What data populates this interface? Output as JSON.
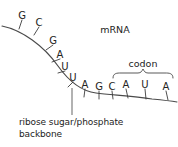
{
  "figure": {
    "title_label": "mRNA",
    "codon_label": "codon",
    "caption_line_1": "ribose sugar/phosphate",
    "caption_line_2": "backbone",
    "stroke_color": "#3c3c3c",
    "text_color": "#232323",
    "background_color": "#ffffff"
  },
  "sequence": {
    "description": "mRNA nucleotide bases along ribose sugar/phosphate backbone",
    "bases": [
      {
        "letter": "G",
        "x": 22,
        "y": 15
      },
      {
        "letter": "C",
        "x": 39,
        "y": 22
      },
      {
        "letter": "G",
        "x": 53,
        "y": 40
      },
      {
        "letter": "A",
        "x": 60,
        "y": 54
      },
      {
        "letter": "U",
        "x": 65,
        "y": 66
      },
      {
        "letter": "U",
        "x": 73,
        "y": 77
      },
      {
        "letter": "A",
        "x": 85,
        "y": 84
      },
      {
        "letter": "G",
        "x": 99,
        "y": 86
      },
      {
        "letter": "C",
        "x": 112,
        "y": 86
      },
      {
        "letter": "A",
        "x": 126,
        "y": 84
      },
      {
        "letter": "U",
        "x": 145,
        "y": 84
      },
      {
        "letter": "A",
        "x": 166,
        "y": 86
      }
    ],
    "codon_bases": [
      "A",
      "U",
      "A"
    ],
    "codon_span_start_x": 113,
    "codon_span_end_x": 173
  }
}
